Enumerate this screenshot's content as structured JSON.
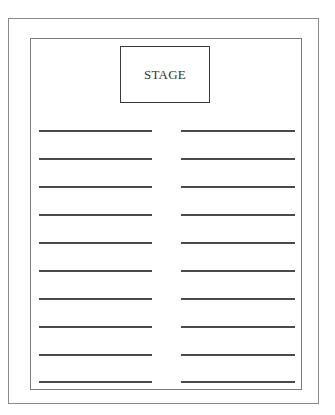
{
  "diagram": {
    "type": "seating-layout",
    "stage": {
      "label": "STAGE"
    },
    "rows": 10,
    "columns": 2,
    "row_positions_y": [
      130,
      158,
      186,
      214,
      242,
      270,
      298,
      326,
      354,
      381
    ],
    "left_column": {
      "x_start": 39,
      "x_end": 152
    },
    "right_column": {
      "x_start": 181,
      "x_end": 295
    },
    "colors": {
      "border": "#7a7a7a",
      "line": "#4a4a4a",
      "stage_border": "#3a3a3a"
    }
  }
}
